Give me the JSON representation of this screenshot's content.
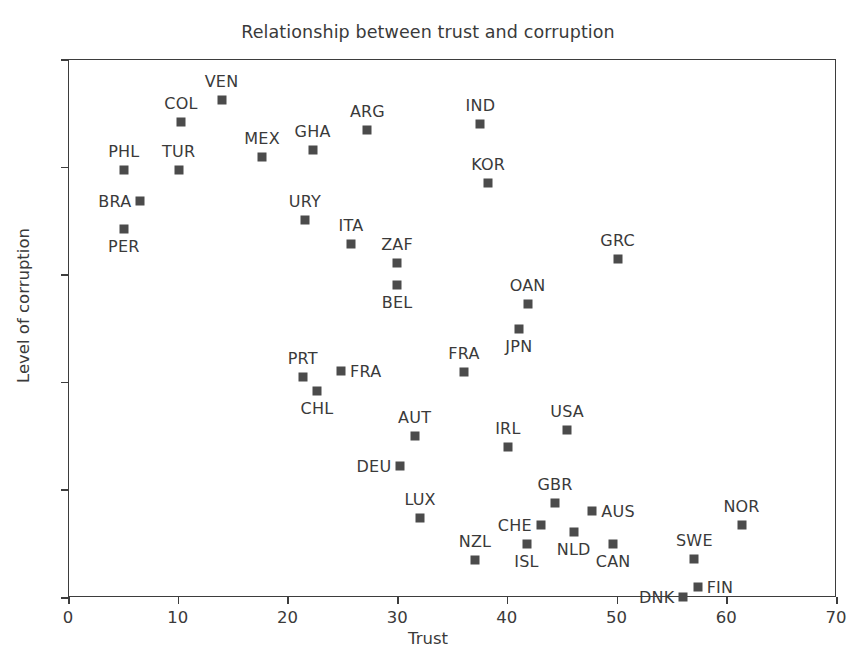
{
  "chart_data": {
    "type": "scatter",
    "title": "Relationship between trust and corruption",
    "xlabel": "Trust",
    "ylabel": "Level of corruption",
    "xlim": [
      0,
      70
    ],
    "ylim": [
      0,
      100
    ],
    "xticks": [
      0,
      10,
      20,
      30,
      40,
      50,
      60,
      70
    ],
    "yticks": [
      0,
      20,
      40,
      60,
      80,
      100
    ],
    "grid": false,
    "legend": null,
    "marker_color": "#4b4b4b",
    "marker_shape": "square",
    "points": [
      {
        "label": "PHL",
        "x": 5.0,
        "y": 79.5,
        "label_pos": "above"
      },
      {
        "label": "BRA",
        "x": 6.5,
        "y": 73.8,
        "label_pos": "left"
      },
      {
        "label": "PER",
        "x": 5.0,
        "y": 68.6,
        "label_pos": "below"
      },
      {
        "label": "TUR",
        "x": 10.0,
        "y": 79.6,
        "label_pos": "above"
      },
      {
        "label": "COL",
        "x": 10.2,
        "y": 88.5,
        "label_pos": "above"
      },
      {
        "label": "VEN",
        "x": 13.9,
        "y": 92.5,
        "label_pos": "above"
      },
      {
        "label": "MEX",
        "x": 17.6,
        "y": 81.9,
        "label_pos": "above"
      },
      {
        "label": "GHA",
        "x": 22.2,
        "y": 83.3,
        "label_pos": "above"
      },
      {
        "label": "ARG",
        "x": 27.2,
        "y": 86.9,
        "label_pos": "above"
      },
      {
        "label": "IND",
        "x": 37.5,
        "y": 88.1,
        "label_pos": "above"
      },
      {
        "label": "KOR",
        "x": 38.2,
        "y": 77.2,
        "label_pos": "above"
      },
      {
        "label": "URY",
        "x": 21.5,
        "y": 70.2,
        "label_pos": "above"
      },
      {
        "label": "ITA",
        "x": 25.7,
        "y": 65.8,
        "label_pos": "above"
      },
      {
        "label": "ZAF",
        "x": 29.9,
        "y": 62.2,
        "label_pos": "above"
      },
      {
        "label": "BEL",
        "x": 29.9,
        "y": 58.2,
        "label_pos": "below"
      },
      {
        "label": "GRC",
        "x": 50.0,
        "y": 63.1,
        "label_pos": "above"
      },
      {
        "label": "OAN",
        "x": 41.8,
        "y": 54.6,
        "label_pos": "above"
      },
      {
        "label": "JPN",
        "x": 41.0,
        "y": 50.0,
        "label_pos": "below"
      },
      {
        "label": "PRT",
        "x": 21.3,
        "y": 41.1,
        "label_pos": "above"
      },
      {
        "label": "CHL",
        "x": 22.6,
        "y": 38.5,
        "label_pos": "below"
      },
      {
        "label": "FRA",
        "x": 24.8,
        "y": 42.2,
        "label_pos": "right"
      },
      {
        "label": "FRA",
        "x": 36.0,
        "y": 42.1,
        "label_pos": "above"
      },
      {
        "label": "AUT",
        "x": 31.5,
        "y": 30.1,
        "label_pos": "above"
      },
      {
        "label": "DEU",
        "x": 30.2,
        "y": 24.6,
        "label_pos": "left"
      },
      {
        "label": "IRL",
        "x": 40.0,
        "y": 28.1,
        "label_pos": "above"
      },
      {
        "label": "USA",
        "x": 45.4,
        "y": 31.3,
        "label_pos": "above"
      },
      {
        "label": "LUX",
        "x": 32.0,
        "y": 14.8,
        "label_pos": "above"
      },
      {
        "label": "GBR",
        "x": 44.3,
        "y": 17.6,
        "label_pos": "above"
      },
      {
        "label": "CHE",
        "x": 43.0,
        "y": 13.6,
        "label_pos": "left"
      },
      {
        "label": "NLD",
        "x": 46.0,
        "y": 12.3,
        "label_pos": "below"
      },
      {
        "label": "AUS",
        "x": 47.7,
        "y": 16.1,
        "label_pos": "right"
      },
      {
        "label": "ISL",
        "x": 41.7,
        "y": 10.0,
        "label_pos": "below"
      },
      {
        "label": "CAN",
        "x": 49.6,
        "y": 10.0,
        "label_pos": "below"
      },
      {
        "label": "NZL",
        "x": 37.0,
        "y": 7.0,
        "label_pos": "above"
      },
      {
        "label": "NOR",
        "x": 61.3,
        "y": 13.6,
        "label_pos": "above"
      },
      {
        "label": "SWE",
        "x": 57.0,
        "y": 7.2,
        "label_pos": "above"
      },
      {
        "label": "FIN",
        "x": 57.3,
        "y": 2.0,
        "label_pos": "right"
      },
      {
        "label": "DNK",
        "x": 56.0,
        "y": 0.2,
        "label_pos": "left"
      }
    ]
  }
}
